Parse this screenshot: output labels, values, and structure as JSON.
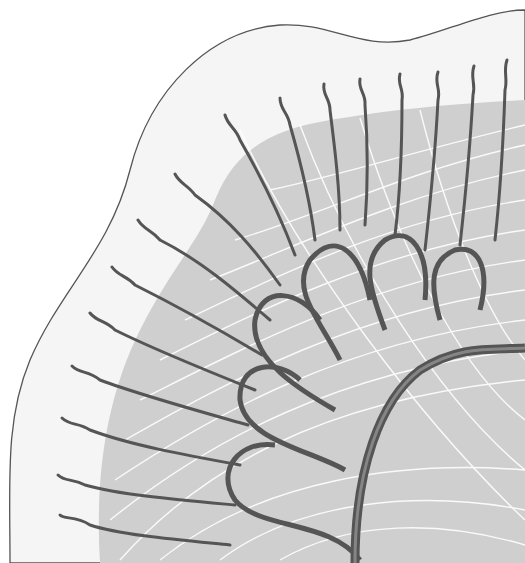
{
  "diagram": {
    "type": "anatomical-illustration",
    "labels": [],
    "colors": {
      "background": "#ffffff",
      "outer_region": "#f4f4f4",
      "outer_outline": "#555555",
      "inner_region": "#cfcfcf",
      "vessel": "#555555",
      "fine_fiber": "#ffffff",
      "trunk_highlight": "#9a9a9a"
    }
  }
}
